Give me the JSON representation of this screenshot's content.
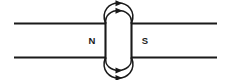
{
  "diagram": {
    "stroke_color": "#1a1a1a",
    "background_color": "#ffffff",
    "labels": {
      "north_pole": "N",
      "south_pole": "S"
    },
    "magnet": {
      "left_x": 105,
      "right_x": 132,
      "top_y": 23,
      "bottom_y": 57
    },
    "horizontal_lines": [
      {
        "name": "upper-left-field-line",
        "x1": 14,
        "y1": 23,
        "x2": 105,
        "y2": 23
      },
      {
        "name": "upper-right-field-line",
        "x1": 132,
        "y1": 23,
        "x2": 217,
        "y2": 23
      },
      {
        "name": "lower-left-field-line",
        "x1": 14,
        "y1": 57,
        "x2": 105,
        "y2": 57
      },
      {
        "name": "lower-right-field-line",
        "x1": 132,
        "y1": 57,
        "x2": 217,
        "y2": 57
      }
    ],
    "arcs": [
      {
        "name": "top-outer-arc",
        "direction": "right",
        "apex_y": 5
      },
      {
        "name": "top-inner-arc",
        "direction": "right",
        "apex_y": 12
      },
      {
        "name": "bottom-inner-arc",
        "direction": "right",
        "apex_y": 68
      },
      {
        "name": "bottom-outer-arc",
        "direction": "right",
        "apex_y": 75
      }
    ],
    "arrow_count": 4,
    "arrow_direction": "rightward"
  }
}
